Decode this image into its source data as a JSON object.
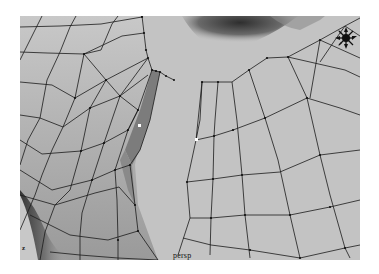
{
  "viewport": {
    "camera_label": "persp",
    "axis_label": "z",
    "mode": "component",
    "colors": {
      "surface": "#c4c4c4",
      "wire": "#1a1a1a",
      "selected_face": "#7a7a7a",
      "selected_vertex": "#ffffff",
      "shadow": "#3a3a3a"
    }
  },
  "manipulator": {
    "icon": "move-manipulator-icon"
  }
}
